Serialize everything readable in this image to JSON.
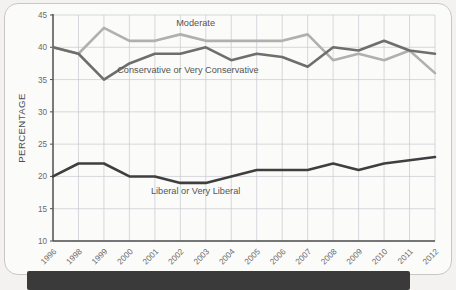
{
  "chart_data": {
    "type": "line",
    "title": "",
    "xlabel": "",
    "ylabel": "PERCENTAGE",
    "ylim": [
      10,
      45
    ],
    "ytick_step": 5,
    "yticks": [
      10,
      15,
      20,
      25,
      30,
      35,
      40,
      45
    ],
    "grid": true,
    "legend_position": "inline-annotations",
    "categories": [
      "1996",
      "1998",
      "1999",
      "2000",
      "2001",
      "2002",
      "2003",
      "2004",
      "2005",
      "2006",
      "2007",
      "2008",
      "2009",
      "2010",
      "2011",
      "2012"
    ],
    "series": [
      {
        "name": "Moderate",
        "color": "#b0b0b0",
        "values": [
          40,
          39,
          43,
          41,
          41,
          42,
          41,
          41,
          41,
          41,
          42,
          38,
          39,
          38,
          39.5,
          36
        ]
      },
      {
        "name": "Conservative or Very Conservative",
        "color": "#6e6e6e",
        "values": [
          40,
          39,
          35,
          37.5,
          39,
          39,
          40,
          38,
          39,
          38.5,
          37,
          40,
          39.5,
          41,
          39.5,
          39
        ]
      },
      {
        "name": "Liberal or Very Liberal",
        "color": "#3f3f3f",
        "values": [
          20,
          22,
          22,
          20,
          20,
          19,
          19,
          20,
          21,
          21,
          21,
          22,
          21,
          22,
          22.5,
          23
        ]
      }
    ],
    "annotations": [
      {
        "text": "Moderate",
        "x_index": 5.6,
        "y": 43.3
      },
      {
        "text": "Conservative or Very Conservative",
        "x_index": 5.3,
        "y": 36.0
      },
      {
        "text": "Liberal or Very Liberal",
        "x_index": 5.6,
        "y": 17.3
      }
    ]
  },
  "axis": {
    "y_title": "PERCENTAGE"
  },
  "caption": {
    "text": ""
  }
}
